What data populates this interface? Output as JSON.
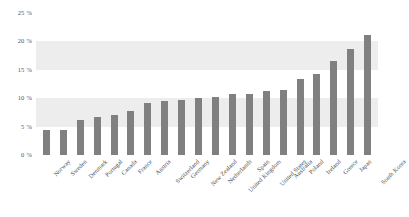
{
  "chart_data": {
    "type": "bar",
    "title": "",
    "xlabel": "",
    "ylabel": "",
    "ylim": [
      0,
      25
    ],
    "grid": false,
    "legend": null,
    "bar_color": "#808080",
    "band_color": "#ededed",
    "y_ticks": [
      "0 %",
      "5 %",
      "10 %",
      "15 %",
      "20 %",
      "25 %"
    ],
    "y_tick_values": [
      0,
      5,
      10,
      15,
      20,
      25
    ],
    "shaded_bands": [
      [
        5,
        10
      ],
      [
        15,
        20
      ]
    ],
    "categories": [
      "Norway",
      "Sweden",
      "Denmark",
      "Portugal",
      "Canada",
      "France",
      "Austria",
      "Switzerland",
      "Germany",
      "New Zealand",
      "Netherlands",
      "United Kingdom",
      "Spain",
      "United States",
      "Australia",
      "Poland",
      "Ireland",
      "Greece",
      "Japan",
      "South Korea"
    ],
    "values": [
      4.4,
      4.4,
      6.2,
      6.7,
      7.1,
      7.8,
      9.2,
      9.5,
      9.6,
      10.0,
      10.2,
      10.8,
      10.8,
      11.2,
      11.5,
      13.3,
      14.3,
      16.6,
      18.7,
      19.2
    ],
    "values_note": "South Korea = 21.1",
    "series": [
      {
        "name": "",
        "values": [
          4.4,
          4.4,
          6.2,
          6.7,
          7.1,
          7.8,
          9.2,
          9.5,
          9.6,
          10.0,
          10.2,
          10.8,
          10.8,
          11.2,
          11.5,
          13.3,
          14.3,
          16.6,
          18.7,
          21.1
        ]
      }
    ]
  }
}
